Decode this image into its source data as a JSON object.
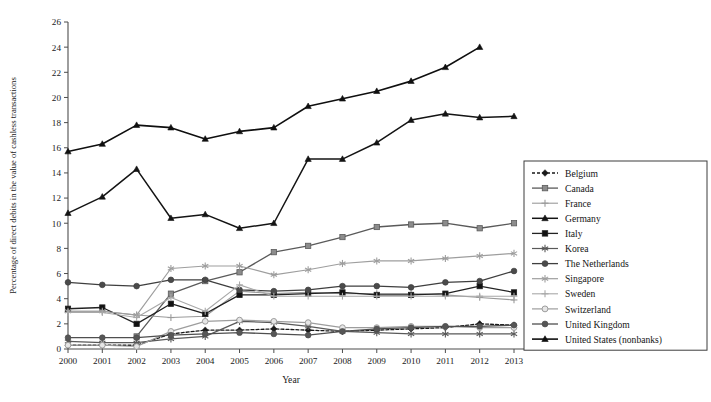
{
  "chart_data": {
    "type": "line",
    "title": "",
    "xlabel": "Year",
    "ylabel": "Percentage of direct debits in the value of cashless transactions",
    "x": [
      2000,
      2001,
      2002,
      2003,
      2004,
      2005,
      2006,
      2007,
      2008,
      2009,
      2010,
      2011,
      2012,
      2013
    ],
    "xlim": [
      2000,
      2013
    ],
    "ylim": [
      0,
      26
    ],
    "yticks": [
      0,
      2,
      4,
      6,
      8,
      10,
      12,
      14,
      16,
      18,
      20,
      22,
      24,
      26
    ],
    "xticks": [
      "2000",
      "2001",
      "2002",
      "2003",
      "2004",
      "2005",
      "2006",
      "2007",
      "2008",
      "2009",
      "2010",
      "2011",
      "2012",
      "2013"
    ],
    "grid": false,
    "legend_position": "right",
    "series": [
      {
        "name": "Belgium",
        "color": "#1a1a1a",
        "marker": "diamond",
        "dash": "3,2",
        "width": 1.3,
        "values": [
          0.3,
          0.3,
          0.3,
          1.2,
          1.5,
          1.5,
          1.6,
          1.5,
          1.4,
          1.5,
          1.6,
          1.7,
          2.0,
          1.9
        ]
      },
      {
        "name": "Canada",
        "color": "#5a5a5a",
        "marker": "square",
        "marker_fill": "#8c8c8c",
        "dash": "",
        "width": 1.3,
        "values": [
          null,
          null,
          1.0,
          4.4,
          5.4,
          6.1,
          7.7,
          8.2,
          8.9,
          9.7,
          9.9,
          10.0,
          9.6,
          10.0
        ]
      },
      {
        "name": "France",
        "color": "#9a9a9a",
        "marker": "plus",
        "dash": "",
        "width": 1.1,
        "values": [
          3.0,
          3.0,
          2.7,
          2.5,
          2.6,
          4.6,
          4.4,
          4.5,
          4.4,
          4.4,
          4.4,
          4.3,
          4.1,
          3.9
        ]
      },
      {
        "name": "Germany",
        "color": "#141414",
        "marker": "triangle",
        "dash": "",
        "width": 1.5,
        "values": [
          10.8,
          12.1,
          14.3,
          10.4,
          10.7,
          9.6,
          10.0,
          15.1,
          15.1,
          16.4,
          18.2,
          18.7,
          18.4,
          18.5
        ]
      },
      {
        "name": "Italy",
        "color": "#222222",
        "marker": "square",
        "marker_fill": "#111111",
        "dash": "",
        "width": 1.3,
        "values": [
          3.2,
          3.3,
          2.0,
          3.6,
          2.8,
          4.3,
          4.3,
          4.4,
          4.5,
          4.3,
          4.3,
          4.4,
          5.0,
          4.5
        ]
      },
      {
        "name": "Korea",
        "color": "#595959",
        "marker": "asterisk",
        "dash": "",
        "width": 1.2,
        "values": [
          0.6,
          0.5,
          0.5,
          0.8,
          1.0,
          2.2,
          2.1,
          1.8,
          1.4,
          1.3,
          1.2,
          1.2,
          1.2,
          1.2
        ]
      },
      {
        "name": "The Netherlands",
        "color": "#3f3f3f",
        "marker": "circle",
        "marker_fill": "#4a4a4a",
        "dash": "",
        "width": 1.3,
        "values": [
          5.3,
          5.1,
          5.0,
          5.5,
          5.5,
          4.7,
          4.6,
          4.7,
          5.0,
          5.0,
          4.9,
          5.3,
          5.4,
          6.2
        ]
      },
      {
        "name": "Singapore",
        "color": "#9e9e9e",
        "marker": "asterisk",
        "dash": "",
        "width": 1.2,
        "values": [
          3.0,
          3.0,
          2.7,
          6.4,
          6.6,
          6.6,
          5.9,
          6.3,
          6.8,
          7.0,
          7.0,
          7.2,
          7.4,
          7.6
        ]
      },
      {
        "name": "Sweden",
        "color": "#a8a8a8",
        "marker": "plus",
        "dash": "",
        "width": 1.1,
        "values": [
          2.9,
          2.9,
          2.5,
          4.1,
          3.0,
          5.1,
          4.2,
          4.2,
          4.2,
          4.2,
          4.2,
          4.2,
          4.2,
          4.2
        ]
      },
      {
        "name": "Switzerland",
        "color": "#9d9d9d",
        "marker": "opencircle",
        "dash": "",
        "width": 1.2,
        "values": [
          0.3,
          0.3,
          0.2,
          1.4,
          2.2,
          2.3,
          2.2,
          2.1,
          1.7,
          1.7,
          1.8,
          1.8,
          1.7,
          1.7
        ]
      },
      {
        "name": "United Kingdom",
        "color": "#4f4f4f",
        "marker": "circle",
        "marker_fill": "#565656",
        "dash": "",
        "width": 1.3,
        "values": [
          0.9,
          0.9,
          0.9,
          1.1,
          1.2,
          1.3,
          1.2,
          1.1,
          1.4,
          1.6,
          1.7,
          1.8,
          1.8,
          1.9
        ]
      },
      {
        "name": "United States (nonbanks)",
        "color": "#0f0f0f",
        "marker": "triangle",
        "dash": "",
        "width": 1.6,
        "values": [
          15.7,
          16.3,
          17.8,
          17.6,
          16.7,
          17.3,
          17.6,
          19.3,
          19.9,
          20.5,
          21.3,
          22.4,
          24.0,
          null
        ]
      }
    ]
  },
  "legend": {
    "items": [
      {
        "label": "Belgium"
      },
      {
        "label": "Canada"
      },
      {
        "label": "France"
      },
      {
        "label": "Germany"
      },
      {
        "label": "Italy"
      },
      {
        "label": "Korea"
      },
      {
        "label": "The Netherlands"
      },
      {
        "label": "Singapore"
      },
      {
        "label": "Sweden"
      },
      {
        "label": "Switzerland"
      },
      {
        "label": "United Kingdom"
      },
      {
        "label": "United States (nonbanks)"
      }
    ]
  }
}
